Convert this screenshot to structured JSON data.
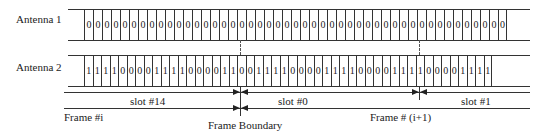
{
  "rows": [
    {
      "label": "Antenna 1",
      "bits": [
        "0",
        "0",
        "0",
        "0",
        "0",
        "0",
        "0",
        "0",
        "0",
        "0",
        "0",
        "0",
        "0",
        "0",
        "0",
        "0",
        "0",
        "0",
        "0",
        "0",
        "0",
        "0",
        "0",
        "0",
        "0",
        "0",
        "0",
        "0",
        "0",
        "0",
        "0",
        "0",
        "0",
        "0",
        "0",
        "0",
        "0",
        "0",
        "0",
        "0",
        "0",
        "0",
        "0",
        "0",
        "0",
        "0",
        "0"
      ]
    },
    {
      "label": "Antenna 2",
      "bits": [
        "1",
        "1",
        "1",
        "1",
        "0",
        "0",
        "0",
        "0",
        "1",
        "1",
        "1",
        "1",
        "0",
        "0",
        "0",
        "0",
        "1",
        "1",
        "0",
        "0",
        "1",
        "1",
        "1",
        "1",
        "0",
        "0",
        "0",
        "0",
        "1",
        "1",
        "1",
        "1",
        "0",
        "0",
        "0",
        "0",
        "1",
        "1",
        "1",
        "1",
        "0",
        "0",
        "0",
        "0",
        "1",
        "1",
        "1",
        "1"
      ]
    }
  ],
  "slots": [
    {
      "label": "slot #14"
    },
    {
      "label": "slot #0"
    },
    {
      "label": "slot #1"
    }
  ],
  "frames": {
    "frame_i": "Frame #i",
    "frame_i1": "Frame # (i+1)",
    "boundary": "Frame Boundary"
  }
}
